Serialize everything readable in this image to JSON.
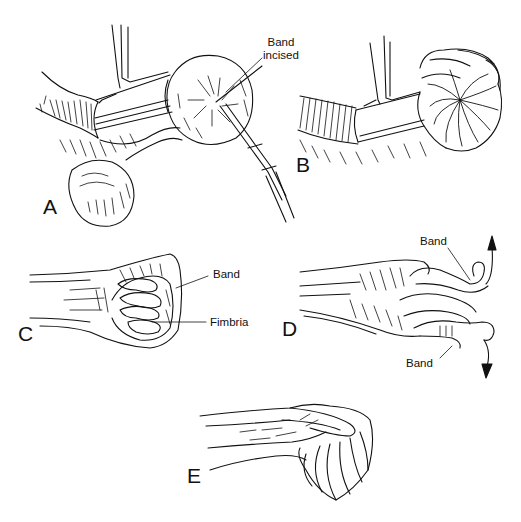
{
  "figure": {
    "panels": [
      {
        "id": "A",
        "letter": "A",
        "callouts": [
          {
            "label_line1": "Band",
            "label_line2": "incised"
          }
        ]
      },
      {
        "id": "B",
        "letter": "B",
        "callouts": []
      },
      {
        "id": "C",
        "letter": "C",
        "callouts": [
          {
            "label": "Band"
          },
          {
            "label": "Fimbria"
          }
        ]
      },
      {
        "id": "D",
        "letter": "D",
        "callouts": [
          {
            "label": "Band"
          },
          {
            "label": "Band"
          }
        ]
      },
      {
        "id": "E",
        "letter": "E",
        "callouts": []
      }
    ],
    "colors": {
      "ink": "#111111",
      "background": "#ffffff"
    }
  }
}
